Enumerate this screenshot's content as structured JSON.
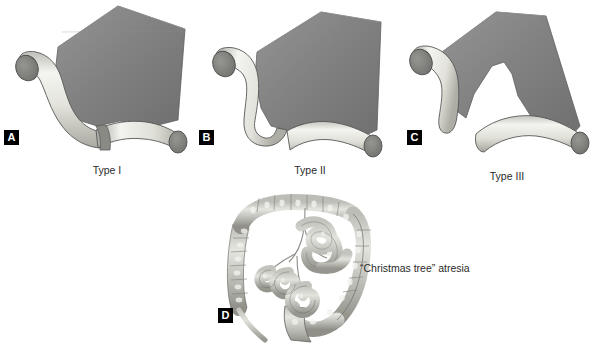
{
  "figure": {
    "background_color": "#ffffff"
  },
  "colors": {
    "mesentery_dark": "#7d7d7d",
    "mesentery_light": "#8e8e8e",
    "bowel_light": "#f2f2ee",
    "bowel_mid": "#d3d3cc",
    "bowel_shadow": "#9a9a94",
    "lumen_dark": "#7a7a78",
    "outline": "#4a4a4a",
    "label_bg": "#000000",
    "label_fg": "#ffffff",
    "text": "#2a2a2a"
  },
  "panels": [
    {
      "id": "a",
      "label": "A",
      "caption": "Type I",
      "description": "mucosal web with intact bowel wall and mesentery"
    },
    {
      "id": "b",
      "label": "B",
      "caption": "Type II",
      "description": "atretic ends joined by fibrous cord with intact mesentery"
    },
    {
      "id": "c",
      "label": "C",
      "caption": "Type III",
      "description": "atretic ends separated by a V-shaped mesenteric defect"
    },
    {
      "id": "d",
      "label": "D",
      "caption": "",
      "annotation": "“Christmas tree” atresia",
      "description": "apple-peel atresia with distal bowel coiled around a single vessel"
    }
  ]
}
